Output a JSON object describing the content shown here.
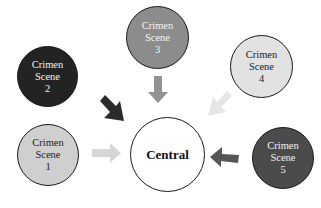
{
  "diagram": {
    "type": "hub-and-spoke",
    "center": {
      "label": "Central",
      "fill": "#ffffff",
      "text_color": "#111111"
    },
    "nodes": [
      {
        "id": "scene-1",
        "line1": "Crimen",
        "line2": "Scene",
        "line3": "1",
        "fill": "#cfcfcf",
        "text_color": "#222222",
        "arrow_color": "#d6d6d6"
      },
      {
        "id": "scene-2",
        "line1": "Crimen",
        "line2": "Scene",
        "line3": "2",
        "fill": "#232323",
        "text_color": "#f2f2f2",
        "arrow_color": "#2b2b2b"
      },
      {
        "id": "scene-3",
        "line1": "Crimen",
        "line2": "Scene",
        "line3": "3",
        "fill": "#8c8c8c",
        "text_color": "#f5f5f5",
        "arrow_color": "#929292"
      },
      {
        "id": "scene-4",
        "line1": "Crimen",
        "line2": "Scene",
        "line3": "4",
        "fill": "#e2e2e2",
        "text_color": "#222222",
        "arrow_color": "#e6e6e6"
      },
      {
        "id": "scene-5",
        "line1": "Crimen",
        "line2": "Scene",
        "line3": "5",
        "fill": "#4b4b4b",
        "text_color": "#f2f2f2",
        "arrow_color": "#565656"
      }
    ],
    "edges": [
      {
        "from": "scene-1",
        "to": "central"
      },
      {
        "from": "scene-2",
        "to": "central"
      },
      {
        "from": "scene-3",
        "to": "central"
      },
      {
        "from": "scene-4",
        "to": "central"
      },
      {
        "from": "scene-5",
        "to": "central"
      }
    ]
  }
}
